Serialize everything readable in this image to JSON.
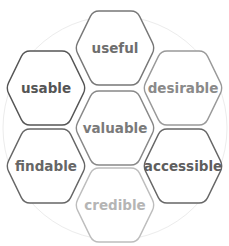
{
  "diagram": {
    "title": "",
    "background_circle": {
      "cx": 115,
      "cy": 128,
      "r": 112,
      "stroke": "#ececec"
    },
    "hexagons": [
      {
        "id": "useful",
        "label": "useful",
        "cx": 115,
        "cy": 48,
        "stroke": "#777777",
        "text_color": "#6e6e6e"
      },
      {
        "id": "usable",
        "label": "usable",
        "cx": 46,
        "cy": 88,
        "stroke": "#555555",
        "text_color": "#555555"
      },
      {
        "id": "desirable",
        "label": "desirable",
        "cx": 183,
        "cy": 88,
        "stroke": "#999999",
        "text_color": "#8a8a8a"
      },
      {
        "id": "valuable",
        "label": "valuable",
        "cx": 115,
        "cy": 128,
        "stroke": "#888888",
        "text_color": "#7a7a7a"
      },
      {
        "id": "findable",
        "label": "findable",
        "cx": 46,
        "cy": 166,
        "stroke": "#666666",
        "text_color": "#666666"
      },
      {
        "id": "accessible",
        "label": "accessible",
        "cx": 183,
        "cy": 166,
        "stroke": "#666666",
        "text_color": "#5e5e5e"
      },
      {
        "id": "credible",
        "label": "credible",
        "cx": 115,
        "cy": 205,
        "stroke": "#bdbdbd",
        "text_color": "#b5b5b5"
      }
    ],
    "hex_size": {
      "half_width": 40,
      "half_height": 37,
      "flat_half_width": 22
    }
  }
}
